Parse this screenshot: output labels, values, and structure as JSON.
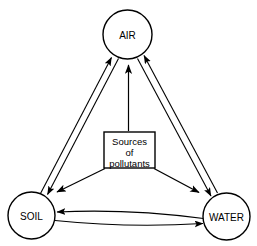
{
  "diagram": {
    "background_color": "#ffffff",
    "line_color": "#000000",
    "nodes": [
      {
        "id": "air",
        "label": "AIR",
        "shape": "circle",
        "cx": 127.5,
        "cy": 34.5,
        "r": 24.5
      },
      {
        "id": "soil",
        "label": "SOIL",
        "shape": "circle",
        "cx": 31.5,
        "cy": 215.5,
        "r": 23.5
      },
      {
        "id": "water",
        "label": "WATER",
        "shape": "circle",
        "cx": 226.5,
        "cy": 216.5,
        "r": 23.5
      }
    ],
    "center_box": {
      "id": "sources",
      "shape": "rectangle",
      "x": 104,
      "y": 132,
      "width": 51,
      "height": 36,
      "lines": [
        "Sources",
        "of",
        "pollutants"
      ]
    },
    "exchange_links": [
      {
        "from": "soil",
        "to": "air",
        "style": "double-line",
        "arrowheads": "both"
      },
      {
        "from": "air",
        "to": "water",
        "style": "double-line",
        "arrowheads": "both"
      },
      {
        "from": "soil",
        "to": "water",
        "style": "double-line",
        "arrowheads": "both"
      }
    ],
    "source_arrows": [
      {
        "from": "sources",
        "to": "air",
        "arrowheads": "end"
      },
      {
        "from": "sources",
        "to": "soil",
        "arrowheads": "end"
      },
      {
        "from": "sources",
        "to": "water",
        "arrowheads": "end"
      }
    ]
  }
}
